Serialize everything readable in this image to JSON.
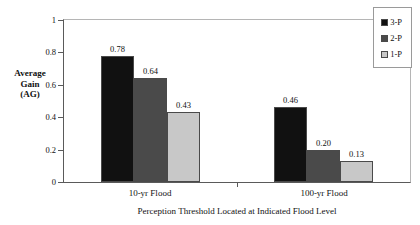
{
  "chart_data": {
    "type": "bar",
    "title": "",
    "xlabel": "Perception Threshold Located at Indicated Flood Level",
    "ylabel": "Average Gain (AG)",
    "ylabel_lines": [
      "Average",
      "Gain",
      "(AG)"
    ],
    "categories": [
      "10-yr Flood",
      "100-yr Flood"
    ],
    "series": [
      {
        "name": "3-P",
        "color": "#111111",
        "values": [
          0.78,
          0.46
        ],
        "labels": [
          "0.78",
          "0.46"
        ]
      },
      {
        "name": "2-P",
        "color": "#4a4a4a",
        "values": [
          0.64,
          0.2
        ],
        "labels": [
          "0.64",
          "0.20"
        ]
      },
      {
        "name": "1-P",
        "color": "#c8c8c8",
        "values": [
          0.43,
          0.13
        ],
        "labels": [
          "0.43",
          "0.13"
        ]
      }
    ],
    "ylim": [
      0,
      1
    ],
    "yticks": [
      0,
      0.2,
      0.4,
      0.6,
      0.8,
      1
    ],
    "ytick_labels": [
      "0",
      "0.2",
      "0.4",
      "0.6",
      "0.8",
      "1"
    ],
    "grid": false,
    "legend_position": "top-right"
  },
  "legend": {
    "items": [
      {
        "label": "3-P",
        "color": "#111111"
      },
      {
        "label": "2-P",
        "color": "#4a4a4a"
      },
      {
        "label": "1-P",
        "color": "#c8c8c8"
      }
    ]
  }
}
